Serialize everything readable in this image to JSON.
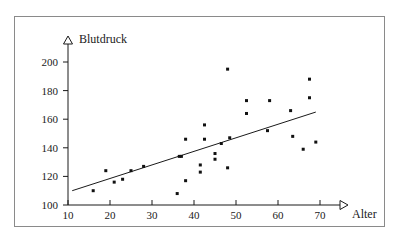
{
  "figure": {
    "background_color": "#ffffff",
    "frame_color": "#8a8a8a",
    "ink_color": "#1a1a1a"
  },
  "chart_data": {
    "type": "scatter",
    "title": "",
    "subtitle": "",
    "xlabel": "Alter",
    "ylabel": "Blutdruck",
    "xlim": [
      10,
      72
    ],
    "ylim": [
      100,
      207
    ],
    "xticks": [
      10,
      20,
      30,
      40,
      50,
      60,
      70
    ],
    "yticks": [
      100,
      120,
      140,
      160,
      180,
      200
    ],
    "xtick_labels": [
      "10",
      "20",
      "30",
      "40",
      "50",
      "60",
      "70"
    ],
    "ytick_labels": [
      "100",
      "120",
      "140",
      "160",
      "180",
      "200"
    ],
    "grid": false,
    "legend": null,
    "axis_style": "open-arrow-tipped",
    "x_axis_arrow": "right-triangle-outline",
    "y_axis_arrow": "up-triangle-outline",
    "marker": "square-dot",
    "marker_color": "#111111",
    "marker_size_px": 3,
    "points": [
      {
        "x": 16.0,
        "y": 110
      },
      {
        "x": 19.0,
        "y": 124
      },
      {
        "x": 21.0,
        "y": 116
      },
      {
        "x": 23.0,
        "y": 118
      },
      {
        "x": 25.0,
        "y": 124
      },
      {
        "x": 28.0,
        "y": 127
      },
      {
        "x": 36.0,
        "y": 108
      },
      {
        "x": 36.5,
        "y": 134
      },
      {
        "x": 37.0,
        "y": 134
      },
      {
        "x": 38.0,
        "y": 117
      },
      {
        "x": 38.0,
        "y": 146
      },
      {
        "x": 41.5,
        "y": 128
      },
      {
        "x": 41.5,
        "y": 123
      },
      {
        "x": 42.5,
        "y": 156
      },
      {
        "x": 42.5,
        "y": 146
      },
      {
        "x": 45.0,
        "y": 136
      },
      {
        "x": 45.0,
        "y": 132
      },
      {
        "x": 46.5,
        "y": 143
      },
      {
        "x": 48.0,
        "y": 195
      },
      {
        "x": 48.0,
        "y": 126
      },
      {
        "x": 48.5,
        "y": 147
      },
      {
        "x": 52.5,
        "y": 173
      },
      {
        "x": 52.5,
        "y": 164
      },
      {
        "x": 57.5,
        "y": 152
      },
      {
        "x": 58.0,
        "y": 173
      },
      {
        "x": 63.0,
        "y": 166
      },
      {
        "x": 63.5,
        "y": 148
      },
      {
        "x": 66.0,
        "y": 139
      },
      {
        "x": 67.5,
        "y": 188
      },
      {
        "x": 67.5,
        "y": 175
      },
      {
        "x": 69.0,
        "y": 144
      }
    ],
    "regression_line": {
      "x_start": 11.0,
      "y_start": 110.0,
      "x_end": 69.0,
      "y_end": 165.0,
      "color": "#1a1a1a",
      "width_px": 1
    }
  }
}
